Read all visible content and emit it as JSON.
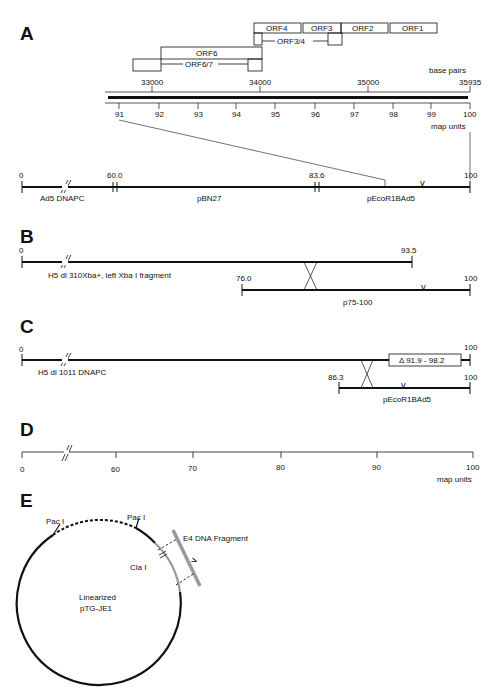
{
  "panels": {
    "A": {
      "letter": "A",
      "orfs": [
        "ORF4",
        "ORF3",
        "ORF2",
        "ORF1",
        "ORF3/4",
        "ORF6",
        "ORF6/7"
      ],
      "bp_label": "base pairs",
      "bp_ticks": [
        "33000",
        "34000",
        "35000",
        "35935"
      ],
      "mu_ticks": [
        "91",
        "92",
        "93",
        "94",
        "95",
        "96",
        "97",
        "98",
        "99",
        "100"
      ],
      "mu_label": "map units",
      "map_ticks": [
        "0",
        "60.0",
        "83.6",
        "100"
      ],
      "segments": [
        "Ad5 DNAPC",
        "pBN27",
        "pEcoR1BAd5"
      ],
      "marker": "v"
    },
    "B": {
      "letter": "B",
      "top_ticks": [
        "0",
        "93.5"
      ],
      "top_label": "H5 dl  310Xba+, left Xba I fragment",
      "bottom_ticks": [
        "76.0",
        "100"
      ],
      "bottom_label": "p75-100",
      "marker": "v"
    },
    "C": {
      "letter": "C",
      "top_ticks": [
        "0",
        "100"
      ],
      "top_label": "H5 dl 1011 DNAPC",
      "deletion_label": "Δ 91.9 - 98.2",
      "bottom_ticks": [
        "86.3",
        "100"
      ],
      "bottom_label": "pEcoR1BAd5",
      "marker": "v"
    },
    "D": {
      "letter": "D",
      "ticks": [
        "0",
        "60",
        "70",
        "80",
        "90",
        "100"
      ],
      "axis_label": "map units"
    },
    "E": {
      "letter": "E",
      "site_left": "Pac I",
      "site_right": "Pac I",
      "site_cla": "Cla I",
      "fragment_label": "E4 DNA Fragment",
      "plasmid_line1": "Linearized",
      "plasmid_line2": "pTG-JE1",
      "marker": "v"
    }
  },
  "colors": {
    "line": "#111111",
    "gray_fragment": "#9a9a9a"
  }
}
